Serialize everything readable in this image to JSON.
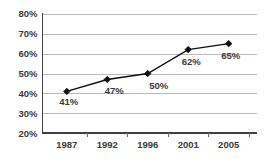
{
  "chart_data": {
    "type": "line",
    "title": "",
    "subtitle": "",
    "xlabel": "",
    "ylabel": "",
    "categories": [
      "1987",
      "1992",
      "1996",
      "2001",
      "2005"
    ],
    "values": [
      41,
      47,
      50,
      62,
      65
    ],
    "point_labels": [
      "41%",
      "47%",
      "50%",
      "62%",
      "65%"
    ],
    "ylim": [
      20,
      80
    ],
    "ytick_values": [
      80,
      70,
      60,
      50,
      40,
      30,
      20
    ],
    "ytick_labels": [
      "80%",
      "70%",
      "60%",
      "50%",
      "40%",
      "30%",
      "20%"
    ],
    "grid": true,
    "legend": false,
    "legend_position": "none",
    "marker": "diamond",
    "colors": {
      "series": "#0f0f0f",
      "gridline": "#b9b9b9",
      "axis": "#404040",
      "text": "#3a3a3a",
      "background": "#ffffff"
    }
  }
}
